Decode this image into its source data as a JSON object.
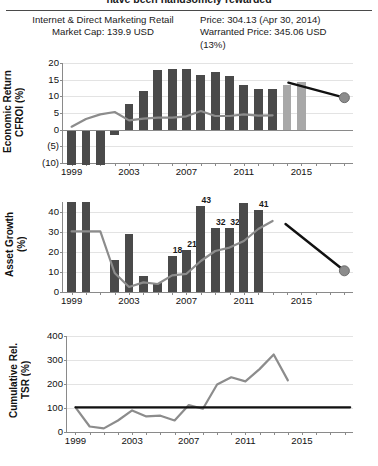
{
  "header": {
    "clipped_title": "have been handsomely rewarded",
    "company_line1": "Internet & Direct Marketing Retail",
    "company_line2": "Market Cap: 139.9 USD",
    "price_line": "Price: 304.13 (Apr 30, 2014)",
    "warranted_line": "Warranted Price: 345.06 USD",
    "upside_line": "(13%)"
  },
  "colors": {
    "bar_actual": "#4a4a4a",
    "bar_forecast": "#a8a8a8",
    "line_gray": "#8c8c8c",
    "line_black": "#111111",
    "axis": "#8a8a8a",
    "grid": "#e3e3e3"
  },
  "chart_data": [
    {
      "id": "cfroi",
      "type": "bar",
      "title": "",
      "ylabel": "Economic Return\nCFROI (%)",
      "xlabel": "",
      "ylim": [
        -10,
        20
      ],
      "yticks": [
        -10,
        -5,
        0,
        5,
        10,
        15,
        20
      ],
      "ytick_labels": [
        "(10)",
        "(5)",
        "0",
        "5",
        "10",
        "15",
        "20"
      ],
      "xlim": [
        1998.4,
        2018.6
      ],
      "xticks": [
        1999,
        2003,
        2007,
        2011,
        2015
      ],
      "xtick_labels": [
        "1999",
        "2003",
        "2007",
        "2011",
        "2015"
      ],
      "grid": true,
      "legend": "none",
      "categories": [
        1999,
        2000,
        2001,
        2002,
        2003,
        2004,
        2005,
        2006,
        2007,
        2008,
        2009,
        2010,
        2011,
        2012,
        2013,
        2014,
        2015
      ],
      "values": [
        -10.5,
        -10.5,
        -10.5,
        -1.5,
        7.8,
        11.6,
        17.9,
        18.3,
        18.3,
        16.4,
        17.2,
        16.1,
        13.4,
        12.3,
        12.3,
        13.3,
        14.4
      ],
      "bar_kinds": [
        "actual",
        "actual",
        "actual",
        "actual",
        "actual",
        "actual",
        "actual",
        "actual",
        "actual",
        "actual",
        "actual",
        "actual",
        "actual",
        "actual",
        "actual",
        "forecast",
        "forecast"
      ],
      "series": [
        {
          "name": "market-implied",
          "style": "gray-line",
          "x": [
            1999,
            2000,
            2001,
            2002,
            2003,
            2004,
            2005,
            2006,
            2007,
            2008,
            2009,
            2010,
            2011,
            2012,
            2013
          ],
          "values": [
            0.9,
            3.2,
            4.6,
            5.3,
            2.8,
            3.3,
            3.6,
            3.6,
            4.0,
            5.6,
            4.1,
            4.1,
            4.6,
            4.2,
            4.3
          ]
        },
        {
          "name": "forecast-fade",
          "style": "black-line-with-dot",
          "x": [
            2014.1,
            2018.0
          ],
          "values": [
            14.1,
            9.6
          ]
        }
      ]
    },
    {
      "id": "asset_growth",
      "type": "bar",
      "title": "",
      "ylabel": "Asset Growth\n(%)",
      "xlabel": "",
      "ylim": [
        0,
        45
      ],
      "yticks": [
        0,
        10,
        20,
        30,
        40
      ],
      "ytick_labels": [
        "0",
        "10",
        "20",
        "30",
        "40"
      ],
      "xlim": [
        1998.4,
        2018.6
      ],
      "xticks": [
        1999,
        2003,
        2007,
        2011,
        2015
      ],
      "xtick_labels": [
        "1999",
        "2003",
        "2007",
        "2011",
        "2015"
      ],
      "grid": true,
      "legend": "none",
      "categories": [
        1999,
        2000,
        2001,
        2002,
        2003,
        2004,
        2005,
        2006,
        2007,
        2008,
        2009,
        2010,
        2011,
        2012,
        2013
      ],
      "values": [
        45,
        45,
        0,
        16.2,
        29,
        8.2,
        4.5,
        18,
        21,
        43,
        32,
        32,
        44.5,
        41,
        0
      ],
      "value_labels": [
        "",
        "",
        "",
        "",
        "",
        "",
        "",
        "18",
        "21",
        "43",
        "32",
        "32",
        "",
        "41",
        ""
      ],
      "bar_kinds": [
        "actual",
        "actual",
        "none",
        "actual",
        "actual",
        "actual",
        "actual",
        "actual",
        "actual",
        "actual",
        "actual",
        "actual",
        "actual",
        "actual",
        "none"
      ],
      "series": [
        {
          "name": "market-implied",
          "style": "gray-line",
          "x": [
            1999,
            2000,
            2001,
            2002,
            2003,
            2004,
            2005,
            2006,
            2007,
            2008,
            2009,
            2010,
            2011,
            2012,
            2013
          ],
          "values": [
            30.3,
            30.3,
            30.3,
            9.5,
            2.5,
            4.8,
            4.0,
            8.3,
            9.1,
            15.5,
            20.5,
            22.2,
            25.5,
            31.5,
            35.5
          ]
        },
        {
          "name": "forecast-fade",
          "style": "black-line-with-dot",
          "x": [
            2013.9,
            2018.0
          ],
          "values": [
            34.0,
            10.6
          ]
        }
      ]
    },
    {
      "id": "cumulative_rel_tsr",
      "type": "line",
      "title": "",
      "ylabel": "Cumulative Rel.\nTSR (%)",
      "xlabel": "",
      "ylim": [
        0,
        400
      ],
      "yticks": [
        0,
        100,
        200,
        300,
        400
      ],
      "ytick_labels": [
        "0",
        "100",
        "200",
        "300",
        "400"
      ],
      "xlim": [
        1998.4,
        2018.6
      ],
      "xticks": [
        1999,
        2003,
        2007,
        2011,
        2015
      ],
      "xtick_labels": [
        "1999",
        "2003",
        "2007",
        "2011",
        "2015"
      ],
      "grid": true,
      "legend": "none",
      "series": [
        {
          "name": "cumulative-relative-tsr",
          "style": "gray-line",
          "x": [
            1999,
            2000,
            2001,
            2002,
            2003,
            2004,
            2005,
            2006,
            2007,
            2008,
            2009,
            2010,
            2011,
            2012,
            2013,
            2014
          ],
          "values": [
            103,
            23,
            15,
            48,
            90,
            65,
            68,
            48,
            112,
            97,
            198,
            228,
            211,
            262,
            323,
            215
          ]
        },
        {
          "name": "benchmark",
          "style": "black-flat-line",
          "x": [
            1999,
            2018.4
          ],
          "values": [
            103,
            103
          ]
        }
      ]
    }
  ]
}
